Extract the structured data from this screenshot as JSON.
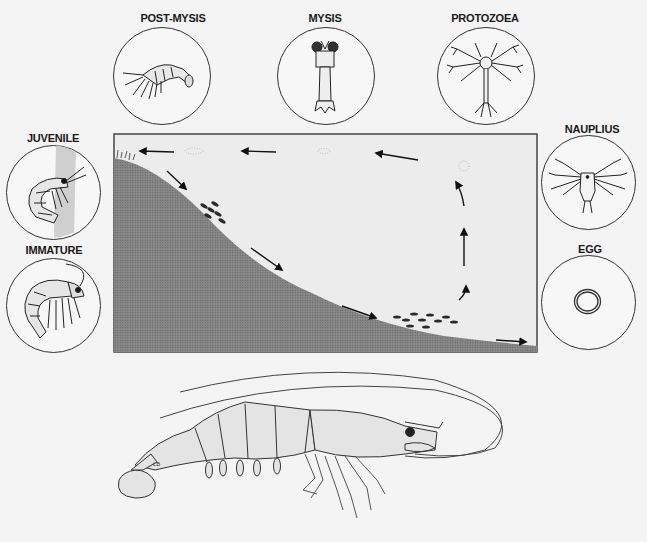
{
  "diagram": {
    "stages": [
      {
        "id": "post-mysis",
        "label": "POST-MYSIS"
      },
      {
        "id": "mysis",
        "label": "MYSIS"
      },
      {
        "id": "protozoea",
        "label": "PROTOZOEA"
      },
      {
        "id": "nauplius",
        "label": "NAUPLIUS"
      },
      {
        "id": "egg",
        "label": "EGG"
      },
      {
        "id": "juvenile",
        "label": "JUVENILE"
      },
      {
        "id": "immature",
        "label": "IMMATURE"
      }
    ],
    "cross_section": {
      "description": "Coastal slope cross-section with arrows showing migration from estuary shore to offshore spawning grounds and larval drift back toward shore",
      "arrows": [
        "shore-to-slope",
        "slope-down-1",
        "slope-down-2",
        "offshore-bottom",
        "rise-1",
        "rise-2",
        "surface-drift-1",
        "surface-drift-2",
        "surface-drift-3"
      ]
    },
    "adult": {
      "label": "Adult shrimp",
      "signature": "LB"
    }
  }
}
